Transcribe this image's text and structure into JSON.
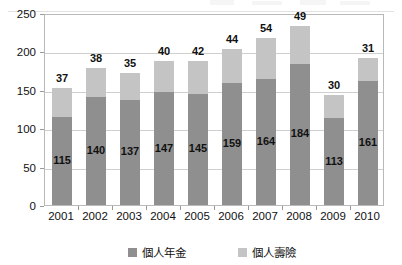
{
  "chart_data": {
    "type": "bar",
    "stacked": true,
    "title": "",
    "subtitle": "",
    "xlabel": "",
    "ylabel": "",
    "categories": [
      "2001",
      "2002",
      "2003",
      "2004",
      "2005",
      "2006",
      "2007",
      "2008",
      "2009",
      "2010"
    ],
    "series": [
      {
        "name": "個人年金",
        "color": "#8f8f8f",
        "values": [
          115,
          140,
          137,
          147,
          145,
          159,
          164,
          184,
          113,
          161
        ]
      },
      {
        "name": "個人壽險",
        "color": "#c4c4c4",
        "values": [
          37,
          38,
          35,
          40,
          42,
          44,
          54,
          49,
          30,
          31
        ]
      }
    ],
    "totals": [
      152,
      178,
      172,
      187,
      187,
      203,
      218,
      233,
      143,
      192
    ],
    "ylim": [
      0,
      250
    ],
    "yticks": [
      0,
      50,
      100,
      150,
      200,
      250
    ],
    "ytick_labels": [
      "0",
      "50",
      "100",
      "150",
      "200",
      "250"
    ],
    "grid": true,
    "grid_axis": "y",
    "legend_position": "bottom",
    "data_labels": {
      "series_0_position": "inside",
      "series_1_position": "above-bar"
    }
  },
  "legend": {
    "items": [
      {
        "label": "個人年金",
        "color": "#8f8f8f"
      },
      {
        "label": "個人壽險",
        "color": "#c4c4c4"
      }
    ]
  },
  "colors": {
    "annuity": "#8f8f8f",
    "life": "#c4c4c4",
    "gridline": "#cfcfcf",
    "frame": "#b9b9b9",
    "text": "#111111",
    "background": "#ffffff"
  }
}
